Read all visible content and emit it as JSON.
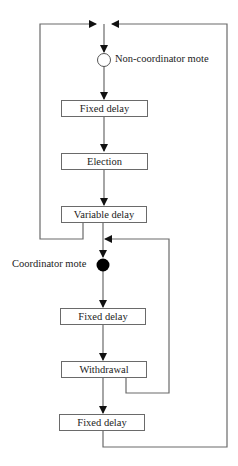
{
  "diagram": {
    "type": "flowchart",
    "nodes": {
      "non_coordinator": {
        "label": "Non-coordinator mote",
        "shape": "open-circle"
      },
      "fixed_delay_1": {
        "label": "Fixed delay"
      },
      "election": {
        "label": "Election"
      },
      "variable_delay": {
        "label": "Variable delay"
      },
      "coordinator": {
        "label": "Coordinator mote",
        "shape": "filled-circle"
      },
      "fixed_delay_2": {
        "label": "Fixed delay"
      },
      "withdrawal": {
        "label": "Withdrawal"
      },
      "fixed_delay_3": {
        "label": "Fixed delay"
      }
    },
    "edges": [
      [
        "non_coordinator",
        "fixed_delay_1"
      ],
      [
        "fixed_delay_1",
        "election"
      ],
      [
        "election",
        "variable_delay"
      ],
      [
        "variable_delay",
        "non_coordinator"
      ],
      [
        "variable_delay",
        "coordinator"
      ],
      [
        "coordinator",
        "fixed_delay_2"
      ],
      [
        "fixed_delay_2",
        "withdrawal"
      ],
      [
        "withdrawal",
        "coordinator"
      ],
      [
        "withdrawal",
        "fixed_delay_3"
      ],
      [
        "fixed_delay_3",
        "non_coordinator"
      ]
    ],
    "colors": {
      "line": "#6a6a6a",
      "text": "#222222",
      "filled_node": "#000000"
    }
  }
}
